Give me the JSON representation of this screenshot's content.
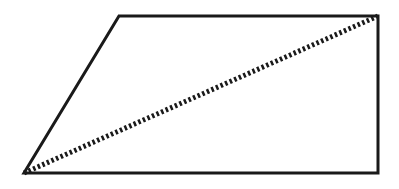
{
  "diagram": {
    "type": "trapezoid-with-diagonal",
    "background": "#ffffff",
    "stroke_color": "#1a1a1a",
    "stroke_width": 3,
    "trapezoid": {
      "vertices": [
        {
          "label": "",
          "x": 119,
          "y": 16
        },
        {
          "label": "",
          "x": 378,
          "y": 16
        },
        {
          "label": "",
          "x": 378,
          "y": 173
        },
        {
          "label": "",
          "x": 24,
          "y": 173
        }
      ]
    },
    "diagonal": {
      "style": "dotted",
      "from": {
        "x": 24,
        "y": 173
      },
      "to": {
        "x": 378,
        "y": 16
      },
      "stroke_width": 5,
      "dash": "2.5 2.5"
    }
  }
}
